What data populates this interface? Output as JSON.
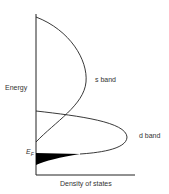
{
  "diagram": {
    "y_axis_label": "Energy",
    "x_axis_label": "Density of states",
    "s_band_label": "s band",
    "d_band_label": "d band",
    "fermi_label": "E",
    "fermi_subscript": "F"
  },
  "colors": {
    "line": "#222222",
    "fill": "#000000",
    "text": "#333333"
  }
}
